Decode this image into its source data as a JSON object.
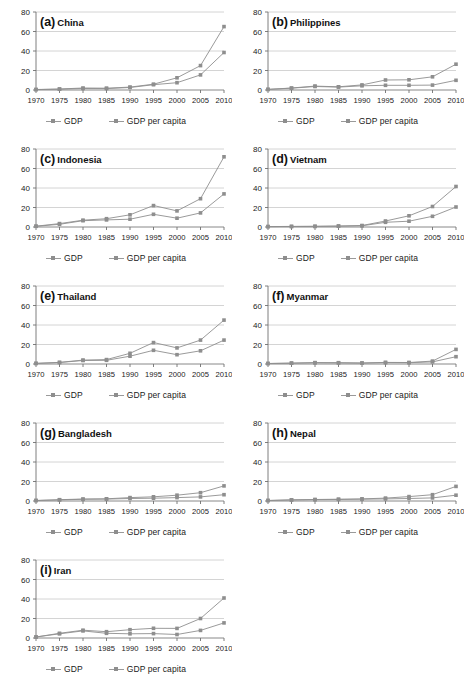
{
  "figure": {
    "axis": {
      "y_ticks": [
        0,
        20,
        40,
        60,
        80
      ],
      "ylim": [
        0,
        80
      ],
      "x_ticks": [
        "1970",
        "1975",
        "1980",
        "1985",
        "1990",
        "1995",
        "2000",
        "2005",
        "2010"
      ],
      "grid": "horizontal"
    },
    "legend": {
      "position": "below-panel",
      "series1_label": "GDP",
      "series2_label": "GDP per capita",
      "series1_color": "#8e8e8e",
      "series2_color": "#8e8e8e",
      "marker": "square"
    }
  },
  "chart_data": [
    {
      "type": "line",
      "panel": "(a)",
      "title": "China",
      "xlabel": "",
      "ylabel": "",
      "ylim": [
        0,
        80
      ],
      "x": [
        1970,
        1975,
        1980,
        1985,
        1990,
        1995,
        2000,
        2005,
        2010
      ],
      "categories": [
        "1970",
        "1975",
        "1980",
        "1985",
        "1990",
        "1995",
        "2000",
        "2005",
        "2010"
      ],
      "series": [
        {
          "name": "GDP",
          "values": [
            0.5,
            1.0,
            2.0,
            1.8,
            3.0,
            6.0,
            12.5,
            25.0,
            65.0
          ]
        },
        {
          "name": "GDP per capita",
          "values": [
            0.4,
            0.8,
            1.5,
            1.4,
            2.6,
            5.4,
            7.5,
            15.5,
            38.5
          ]
        }
      ]
    },
    {
      "type": "line",
      "panel": "(b)",
      "title": "Philippines",
      "xlabel": "",
      "ylabel": "",
      "ylim": [
        0,
        80
      ],
      "x": [
        1970,
        1975,
        1980,
        1985,
        1990,
        1995,
        2000,
        2005,
        2010
      ],
      "categories": [
        "1970",
        "1975",
        "1980",
        "1985",
        "1990",
        "1995",
        "2000",
        "2005",
        "2010"
      ],
      "series": [
        {
          "name": "GDP",
          "values": [
            0.6,
            2.0,
            4.0,
            3.3,
            5.2,
            10.3,
            10.5,
            13.5,
            26.5
          ]
        },
        {
          "name": "GDP per capita",
          "values": [
            0.6,
            1.8,
            3.6,
            3.0,
            4.3,
            4.8,
            4.8,
            5.0,
            10.0
          ]
        }
      ]
    },
    {
      "type": "line",
      "panel": "(c)",
      "title": "Indonesia",
      "xlabel": "",
      "ylabel": "",
      "ylim": [
        0,
        80
      ],
      "x": [
        1970,
        1975,
        1980,
        1985,
        1990,
        1995,
        2000,
        2005,
        2010
      ],
      "categories": [
        "1970",
        "1975",
        "1980",
        "1985",
        "1990",
        "1995",
        "2000",
        "2005",
        "2010"
      ],
      "series": [
        {
          "name": "GDP",
          "values": [
            0.8,
            3.5,
            7.0,
            8.5,
            12.5,
            22.0,
            16.5,
            29.0,
            72.0
          ]
        },
        {
          "name": "GDP per capita",
          "values": [
            0.7,
            2.8,
            6.5,
            7.3,
            8.0,
            13.0,
            9.0,
            14.5,
            34.0
          ]
        }
      ]
    },
    {
      "type": "line",
      "panel": "(d)",
      "title": "Vietnam",
      "xlabel": "",
      "ylabel": "",
      "ylim": [
        0,
        80
      ],
      "x": [
        1970,
        1975,
        1980,
        1985,
        1990,
        1995,
        2000,
        2005,
        2010
      ],
      "categories": [
        "1970",
        "1975",
        "1980",
        "1985",
        "1990",
        "1995",
        "2000",
        "2005",
        "2010"
      ],
      "series": [
        {
          "name": "GDP",
          "values": [
            0.4,
            0.6,
            0.7,
            1.0,
            1.5,
            6.2,
            11.5,
            21.0,
            41.5
          ]
        },
        {
          "name": "GDP per capita",
          "values": [
            0.4,
            0.5,
            0.6,
            0.8,
            1.2,
            4.8,
            6.0,
            11.0,
            20.5
          ]
        }
      ]
    },
    {
      "type": "line",
      "panel": "(e)",
      "title": "Thailand",
      "xlabel": "",
      "ylabel": "",
      "ylim": [
        0,
        80
      ],
      "x": [
        1970,
        1975,
        1980,
        1985,
        1990,
        1995,
        2000,
        2005,
        2010
      ],
      "categories": [
        "1970",
        "1975",
        "1980",
        "1985",
        "1990",
        "1995",
        "2000",
        "2005",
        "2010"
      ],
      "series": [
        {
          "name": "GDP",
          "values": [
            0.6,
            1.6,
            4.0,
            4.5,
            11.0,
            22.0,
            16.5,
            24.5,
            45.0
          ]
        },
        {
          "name": "GDP per capita",
          "values": [
            0.6,
            1.5,
            3.6,
            3.8,
            8.0,
            14.0,
            9.5,
            13.5,
            24.5
          ]
        }
      ]
    },
    {
      "type": "line",
      "panel": "(f)",
      "title": "Myanmar",
      "xlabel": "",
      "ylabel": "",
      "ylim": [
        0,
        80
      ],
      "x": [
        1970,
        1975,
        1980,
        1985,
        1990,
        1995,
        2000,
        2005,
        2010
      ],
      "categories": [
        "1970",
        "1975",
        "1980",
        "1985",
        "1990",
        "1995",
        "2000",
        "2005",
        "2010"
      ],
      "series": [
        {
          "name": "GDP",
          "values": [
            0.5,
            0.9,
            1.4,
            1.3,
            1.0,
            1.6,
            1.5,
            3.0,
            15.0
          ]
        },
        {
          "name": "GDP per capita",
          "values": [
            0.5,
            0.8,
            1.2,
            1.1,
            0.9,
            1.4,
            1.3,
            2.2,
            7.5
          ]
        }
      ]
    },
    {
      "type": "line",
      "panel": "(g)",
      "title": "Bangladesh",
      "xlabel": "",
      "ylabel": "",
      "ylim": [
        0,
        80
      ],
      "x": [
        1970,
        1975,
        1980,
        1985,
        1990,
        1995,
        2000,
        2005,
        2010
      ],
      "categories": [
        "1970",
        "1975",
        "1980",
        "1985",
        "1990",
        "1995",
        "2000",
        "2005",
        "2010"
      ],
      "series": [
        {
          "name": "GDP",
          "values": [
            0.5,
            1.3,
            2.0,
            2.3,
            3.5,
            4.3,
            6.0,
            8.5,
            15.5
          ]
        },
        {
          "name": "GDP per capita",
          "values": [
            0.5,
            1.1,
            1.7,
            1.9,
            2.6,
            2.9,
            3.5,
            4.2,
            6.5
          ]
        }
      ]
    },
    {
      "type": "line",
      "panel": "(h)",
      "title": "Nepal",
      "xlabel": "",
      "ylabel": "",
      "ylim": [
        0,
        80
      ],
      "x": [
        1970,
        1975,
        1980,
        1985,
        1990,
        1995,
        2000,
        2005,
        2010
      ],
      "categories": [
        "1970",
        "1975",
        "1980",
        "1985",
        "1990",
        "1995",
        "2000",
        "2005",
        "2010"
      ],
      "series": [
        {
          "name": "GDP",
          "values": [
            0.5,
            1.2,
            1.5,
            1.8,
            2.2,
            3.0,
            4.5,
            6.5,
            15.0
          ]
        },
        {
          "name": "GDP per capita",
          "values": [
            0.5,
            1.0,
            1.3,
            1.5,
            1.8,
            2.2,
            2.6,
            3.2,
            6.0
          ]
        }
      ]
    },
    {
      "type": "line",
      "panel": "(i)",
      "title": "Iran",
      "xlabel": "",
      "ylabel": "",
      "ylim": [
        0,
        80
      ],
      "x": [
        1970,
        1975,
        1980,
        1985,
        1990,
        1995,
        2000,
        2005,
        2010
      ],
      "categories": [
        "1970",
        "1975",
        "1980",
        "1985",
        "1990",
        "1995",
        "2000",
        "2005",
        "2010"
      ],
      "series": [
        {
          "name": "GDP",
          "values": [
            1.0,
            4.8,
            8.0,
            6.5,
            8.5,
            10.0,
            9.8,
            20.0,
            41.0
          ]
        },
        {
          "name": "GDP per capita",
          "values": [
            1.0,
            4.3,
            7.3,
            4.8,
            4.3,
            4.5,
            3.6,
            7.8,
            15.5
          ]
        }
      ]
    }
  ]
}
